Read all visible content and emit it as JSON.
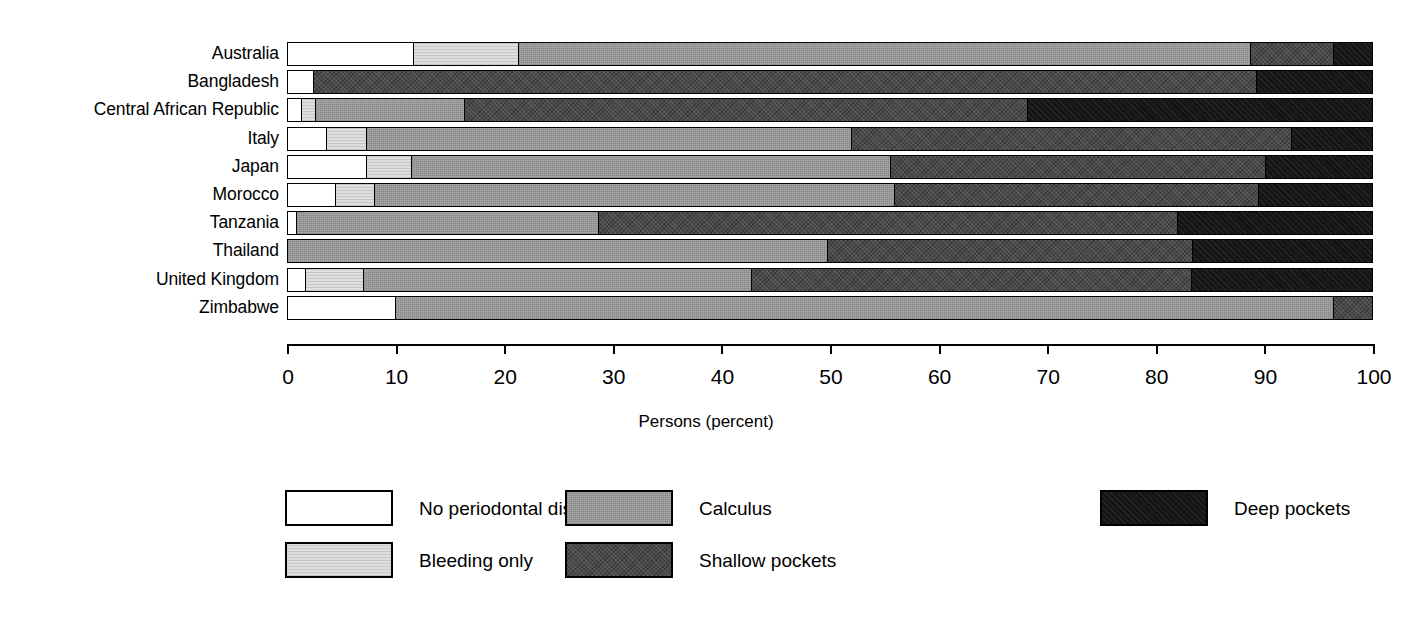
{
  "chart_data": {
    "type": "bar",
    "orientation": "horizontal",
    "stacked": true,
    "title": "",
    "xlabel": "Persons (percent)",
    "ylabel": "",
    "xlim": [
      0,
      100
    ],
    "xticks": [
      0,
      10,
      20,
      30,
      40,
      50,
      60,
      70,
      80,
      90,
      100
    ],
    "xticklabels": [
      "0",
      "10",
      "20",
      "30",
      "40",
      "50",
      "60",
      "70",
      "80",
      "90",
      "100"
    ],
    "grid": false,
    "legend_position": "bottom",
    "categories": [
      "Australia",
      "Bangladesh",
      "Central African Republic",
      "Italy",
      "Japan",
      "Morocco",
      "Tanzania",
      "Thailand",
      "United Kingdom",
      "Zimbabwe"
    ],
    "series": [
      {
        "name": "No periodontal disease",
        "key": "none",
        "color": "#ffffff",
        "values": [
          11.6,
          2.4,
          1.3,
          3.6,
          7.3,
          4.4,
          0.8,
          0.0,
          1.7,
          10.0
        ]
      },
      {
        "name": "Bleeding only",
        "key": "bleeding",
        "color": "#dedede",
        "values": [
          9.7,
          0.0,
          1.3,
          3.7,
          4.1,
          3.6,
          0.0,
          0.0,
          5.3,
          0.0
        ]
      },
      {
        "name": "Calculus",
        "key": "calculus",
        "color": "#a9a9a9",
        "values": [
          67.5,
          0.0,
          13.7,
          44.7,
          44.2,
          48.0,
          27.9,
          49.8,
          35.8,
          86.5
        ]
      },
      {
        "name": "Shallow pockets",
        "key": "shallow",
        "color": "#4a4a4a",
        "values": [
          7.7,
          87.0,
          52.0,
          40.6,
          34.6,
          33.6,
          53.4,
          33.7,
          40.6,
          3.5
        ]
      },
      {
        "name": "Deep pockets",
        "key": "deep",
        "color": "#151515",
        "values": [
          3.5,
          10.6,
          31.7,
          7.4,
          9.8,
          10.4,
          17.9,
          16.5,
          16.6,
          0.0
        ]
      }
    ]
  },
  "legend": {
    "entries": [
      {
        "label": "No periodontal disease",
        "key": "none"
      },
      {
        "label": "Bleeding only",
        "key": "bleeding"
      },
      {
        "label": "Calculus",
        "key": "calculus"
      },
      {
        "label": "Shallow pockets",
        "key": "shallow"
      },
      {
        "label": "Deep pockets",
        "key": "deep"
      }
    ]
  }
}
